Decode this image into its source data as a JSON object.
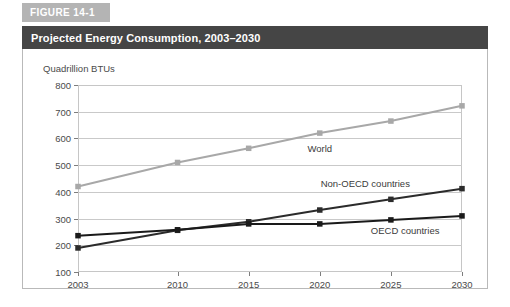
{
  "figure": {
    "tab_label": "FIGURE 14-1",
    "title": "Projected Energy Consumption, 2003–2030"
  },
  "colors": {
    "tab_background": "#b4b4b4",
    "title_background": "#454545",
    "title_text": "#ffffff",
    "panel_border": "#b9b9b9",
    "grid": "#c9c9c9",
    "world_series": "#a8a8a8",
    "non_oecd_series": "#2b2b2b",
    "oecd_series": "#1a1a1a"
  },
  "chart_data": {
    "type": "line",
    "title": "Projected Energy Consumption, 2003–2030",
    "xlabel": "",
    "ylabel": "Quadrillion BTUs",
    "categories": [
      "2003",
      "2010",
      "2015",
      "2020",
      "2025",
      "2030"
    ],
    "x": [
      2003,
      2010,
      2015,
      2020,
      2025,
      2030
    ],
    "ylim": [
      100,
      800
    ],
    "yticks": [
      100,
      200,
      300,
      400,
      500,
      600,
      700,
      800
    ],
    "grid": true,
    "legend": "inline-annotations",
    "series": [
      {
        "name": "World",
        "color": "#a8a8a8",
        "marker": "square",
        "values": [
          420,
          510,
          563,
          620,
          665,
          722
        ],
        "label": "World"
      },
      {
        "name": "Non-OECD countries",
        "color": "#2b2b2b",
        "marker": "square",
        "values": [
          190,
          256,
          288,
          332,
          372,
          412
        ],
        "label": "Non-OECD countries"
      },
      {
        "name": "OECD countries",
        "color": "#1a1a1a",
        "marker": "square",
        "values": [
          236,
          258,
          280,
          280,
          295,
          310
        ],
        "label": "OECD countries"
      }
    ],
    "annotations": [
      {
        "text": "World",
        "x": 2020,
        "y": 565
      },
      {
        "text": "Non-OECD countries",
        "x": 2023.2,
        "y": 432
      },
      {
        "text": "OECD countries",
        "x": 2026.0,
        "y": 258
      }
    ]
  }
}
